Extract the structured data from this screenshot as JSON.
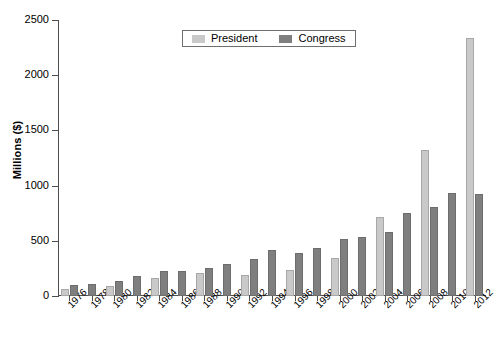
{
  "chart_data": {
    "type": "bar",
    "title": "",
    "xlabel": "",
    "ylabel": "Millions ($)",
    "ylim": [
      0,
      2500
    ],
    "yticks": [
      0,
      500,
      1000,
      1500,
      2000,
      2500
    ],
    "ytick_labels": [
      "0",
      "500",
      "1000",
      "1500",
      "2000",
      "2500"
    ],
    "grid": false,
    "legend_position": "top-center",
    "categories": [
      "1976",
      "1978",
      "1980",
      "1982",
      "1984",
      "1986",
      "1988",
      "1990",
      "1992",
      "1994",
      "1996",
      "1998",
      "2000",
      "2002",
      "2004",
      "2006",
      "2008",
      "2010",
      "2012"
    ],
    "series": [
      {
        "name": "President",
        "color": "#c9c9c9",
        "values": [
          67,
          0,
          92,
          0,
          162,
          0,
          210,
          0,
          192,
          0,
          240,
          0,
          343,
          0,
          718,
          0,
          1325,
          0,
          2340
        ]
      },
      {
        "name": "Congress",
        "color": "#7f7f7f",
        "values": [
          99,
          109,
          140,
          178,
          225,
          225,
          256,
          290,
          331,
          419,
          392,
          435,
          515,
          535,
          580,
          750,
          810,
          930,
          920
        ]
      }
    ]
  },
  "legend": {
    "entries": [
      {
        "label": "President",
        "swatch": "legend-swatch-president"
      },
      {
        "label": "Congress",
        "swatch": "legend-swatch-congress"
      }
    ]
  }
}
